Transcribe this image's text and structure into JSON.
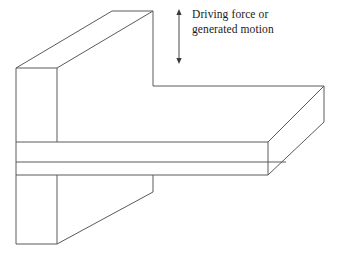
{
  "figure": {
    "background_color": "#ffffff",
    "line_color": "#5a5a5a",
    "text_color": "#1a1a1a",
    "width": 341,
    "height": 256
  },
  "annotation": {
    "label_line_1": "Driving force or",
    "label_line_2": "generated motion",
    "label_full": "Driving force or\ngenerated motion",
    "arrow": {
      "name": "double-headed-vertical-arrow",
      "direction": "up-down",
      "x": 179,
      "y_top": 10,
      "y_bottom": 63,
      "color": "#3a3a3a"
    }
  },
  "parts": [
    {
      "name": "vertical-plate",
      "description": "Upright plate (web) rising from the horizontal plate",
      "faces": [
        {
          "name": "vertical-plate-front-face",
          "points": "16,68 57,68 57,244 16,244"
        },
        {
          "name": "vertical-plate-top-face",
          "points": "16,68 57,68 153,11 112,11"
        },
        {
          "name": "vertical-plate-side-face",
          "points": "57,68 153,11 153,192 57,244"
        }
      ]
    },
    {
      "name": "horizontal-plate",
      "description": "Flat plate extending to the right, drawn with visible thickness",
      "faces": [
        {
          "name": "horizontal-plate-top-face",
          "points": "16,142 268,142 324,86 153,86"
        },
        {
          "name": "horizontal-plate-front-face",
          "points": "16,142 268,142 268,175 16,175"
        },
        {
          "name": "horizontal-plate-end-face",
          "points": "268,142 324,86 324,122 268,175"
        }
      ]
    }
  ],
  "geometry": {
    "edges": [
      {
        "name": "vplate-front-left-edge",
        "d": "M16,68 L16,244"
      },
      {
        "name": "vplate-front-right-edge",
        "d": "M57,68 L57,142"
      },
      {
        "name": "vplate-front-right-edge-lower",
        "d": "M57,175 L57,244"
      },
      {
        "name": "vplate-front-top-edge",
        "d": "M16,68 L57,68"
      },
      {
        "name": "vplate-front-bottom-edge",
        "d": "M16,244 L57,244"
      },
      {
        "name": "vplate-top-back-left-edge",
        "d": "M16,68 L112,11"
      },
      {
        "name": "vplate-top-back-edge",
        "d": "M112,11 L153,11"
      },
      {
        "name": "vplate-top-front-diagonal",
        "d": "M57,68 L153,11"
      },
      {
        "name": "vplate-back-right-edge",
        "d": "M153,11 L153,86"
      },
      {
        "name": "vplate-lower-back-right-edge",
        "d": "M153,175 L153,192"
      },
      {
        "name": "vplate-lower-diagonal",
        "d": "M57,244 L153,192"
      },
      {
        "name": "hplate-top-back-edge",
        "d": "M153,86 L324,86"
      },
      {
        "name": "hplate-top-front-edge",
        "d": "M16,142 L268,142"
      },
      {
        "name": "hplate-top-right-diagonal",
        "d": "M268,142 L324,86"
      },
      {
        "name": "hplate-front-mid-edge",
        "d": "M16,162 L286,162"
      },
      {
        "name": "hplate-front-bottom-edge",
        "d": "M16,175 L268,175"
      },
      {
        "name": "hplate-bottom-right-diagonal",
        "d": "M268,175 L324,122"
      },
      {
        "name": "hplate-right-end-edge",
        "d": "M324,86 L324,122"
      },
      {
        "name": "hplate-front-right-edge",
        "d": "M268,142 L268,175"
      }
    ]
  }
}
